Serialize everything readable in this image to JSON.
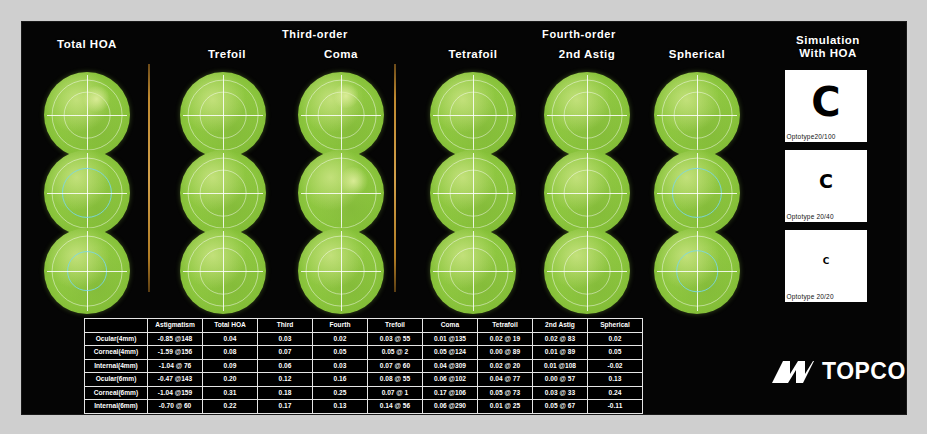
{
  "report": {
    "title": "Higher Order Aberration Analysis",
    "bands": [
      {
        "label": "Third-order"
      },
      {
        "label": "Fourth-order"
      }
    ],
    "map_columns": [
      {
        "label": "Total HOA"
      },
      {
        "label": "Trefoil"
      },
      {
        "label": "Coma"
      },
      {
        "label": "Tetrafoil"
      },
      {
        "label": "2nd Astig"
      },
      {
        "label": "Spherical"
      }
    ],
    "simulation": {
      "title_line1": "Simulation",
      "title_line2": "With HOA",
      "optotypes": [
        {
          "glyph": "C",
          "caption": "Optotype20/100"
        },
        {
          "glyph": "C",
          "caption": "Optotype 20/40"
        },
        {
          "glyph": "C",
          "caption": "Optotype 20/20"
        }
      ]
    },
    "brand": {
      "name": "TOPCON",
      "mark": "topcon-logo-mark"
    },
    "colors": {
      "background": "#050505",
      "map_green": "#8cc63e",
      "separator_orange": "#c08a30",
      "text": "#ffffff",
      "card": "#ffffff"
    },
    "table": {
      "columns": [
        "",
        "Astigmatism",
        "Total HOA",
        "Third",
        "Fourth",
        "Trefoil",
        "Coma",
        "Tetrafoil",
        "2nd Astig",
        "Spherical"
      ],
      "rows": [
        {
          "label": "Ocular(4mm)",
          "values": [
            "-0.85 @148",
            "0.04",
            "0.03",
            "0.02",
            "0.03 @ 55",
            "0.01 @135",
            "0.02 @ 19",
            "0.02 @ 83",
            "0.02"
          ]
        },
        {
          "label": "Corneal(4mm)",
          "values": [
            "-1.59 @156",
            "0.08",
            "0.07",
            "0.05",
            "0.05 @  2",
            "0.05 @124",
            "0.00 @ 89",
            "0.01 @ 89",
            "0.05"
          ]
        },
        {
          "label": "Internal(4mm)",
          "values": [
            "-1.04 @ 76",
            "0.09",
            "0.06",
            "0.03",
            "0.07 @ 60",
            "0.04 @309",
            "0.02 @ 20",
            "0.01 @108",
            "-0.02"
          ]
        },
        {
          "label": "Ocular(6mm)",
          "values": [
            "-0.47 @143",
            "0.20",
            "0.12",
            "0.16",
            "0.08 @ 55",
            "0.06 @102",
            "0.04 @ 77",
            "0.00 @ 57",
            "0.13"
          ]
        },
        {
          "label": "Corneal(6mm)",
          "values": [
            "-1.04 @159",
            "0.31",
            "0.18",
            "0.25",
            "0.07 @  1",
            "0.17 @106",
            "0.05 @ 73",
            "0.03 @ 33",
            "0.24"
          ]
        },
        {
          "label": "Internal(6mm)",
          "values": [
            "-0.70 @ 60",
            "0.22",
            "0.17",
            "0.13",
            "0.14 @ 56",
            "0.06 @290",
            "0.01 @ 25",
            "0.05 @ 67",
            "-0.11"
          ]
        }
      ]
    }
  }
}
